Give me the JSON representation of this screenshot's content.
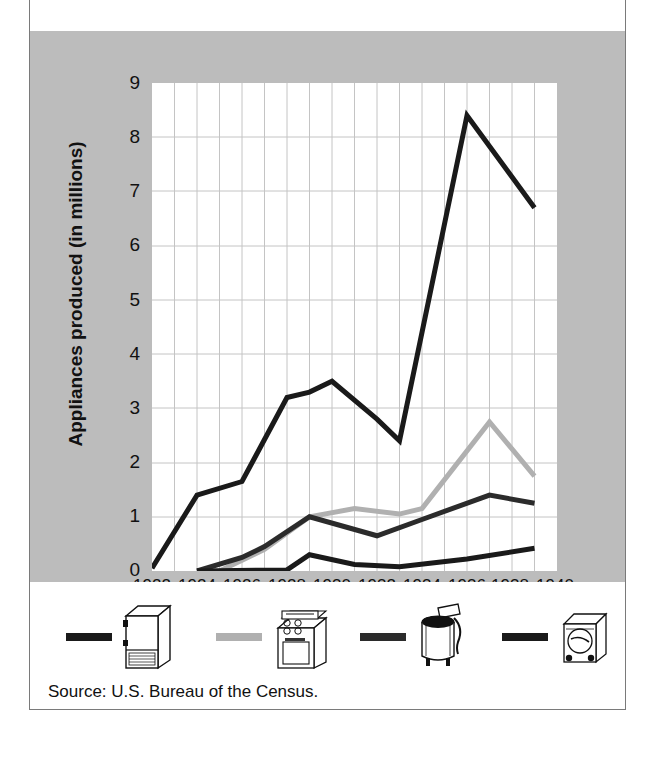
{
  "figure": {
    "title": "Appliances produced in the United States",
    "source": "Source: U.S. Bureau of the Census."
  },
  "axes": {
    "ylabel": "Appliances produced (in millions)",
    "xlabel": "Year",
    "yticks": [
      "0",
      "1",
      "2",
      "3",
      "4",
      "5",
      "6",
      "7",
      "8",
      "9"
    ],
    "xticks": [
      "1922",
      "1924",
      "1926",
      "1928",
      "1930",
      "1932",
      "1934",
      "1936",
      "1938",
      "1940"
    ]
  },
  "legend": {
    "items": [
      {
        "icon": "refrigerator-icon",
        "color": "#1a1a1a"
      },
      {
        "icon": "stove-range-icon",
        "color": "#b0b0b0"
      },
      {
        "icon": "washing-machine-icon",
        "color": "#2b2b2b"
      },
      {
        "icon": "vacuum-cleaner-icon",
        "color": "#1a1a1a"
      }
    ]
  },
  "colors": {
    "panel_gray": "#bcbcbc",
    "plot_white": "#ffffff",
    "grid": "#c8c8c8",
    "series_refrigerator": "#1a1a1a",
    "series_stove": "#b0b0b0",
    "series_washer": "#2b2b2b",
    "series_vacuum": "#1a1a1a"
  },
  "chart_data": {
    "type": "line",
    "title": "Appliances produced in the United States",
    "xlabel": "Year",
    "ylabel": "Appliances produced (in millions)",
    "xlim": [
      1922,
      1940
    ],
    "ylim": [
      0,
      9
    ],
    "xticks": [
      1922,
      1924,
      1926,
      1928,
      1930,
      1932,
      1934,
      1936,
      1938,
      1940
    ],
    "yticks": [
      0,
      1,
      2,
      3,
      4,
      5,
      6,
      7,
      8,
      9
    ],
    "grid": true,
    "legend_position": "below",
    "series": [
      {
        "name": "Refrigerators",
        "icon": "refrigerator-icon",
        "color": "#1a1a1a",
        "x": [
          1922,
          1924,
          1926,
          1928,
          1929,
          1930,
          1932,
          1933,
          1936,
          1939
        ],
        "values": [
          0.05,
          1.4,
          1.65,
          3.2,
          3.3,
          3.5,
          2.8,
          2.4,
          8.4,
          6.7
        ]
      },
      {
        "name": "Stoves and ranges",
        "icon": "stove-range-icon",
        "color": "#b0b0b0",
        "x": [
          1925,
          1926,
          1927,
          1929,
          1931,
          1933,
          1934,
          1937,
          1939
        ],
        "values": [
          0.0,
          0.2,
          0.4,
          1.0,
          1.15,
          1.05,
          1.15,
          2.75,
          1.75
        ]
      },
      {
        "name": "Washing machines",
        "icon": "washing-machine-icon",
        "color": "#2b2b2b",
        "x": [
          1924,
          1926,
          1927,
          1929,
          1932,
          1934,
          1937,
          1939
        ],
        "values": [
          0.0,
          0.25,
          0.45,
          1.0,
          0.65,
          0.95,
          1.4,
          1.25
        ]
      },
      {
        "name": "Vacuum cleaners",
        "icon": "vacuum-cleaner-icon",
        "color": "#1a1a1a",
        "x": [
          1924,
          1928,
          1929,
          1931,
          1933,
          1936,
          1939
        ],
        "values": [
          0.0,
          0.02,
          0.3,
          0.12,
          0.08,
          0.22,
          0.42
        ]
      }
    ]
  }
}
